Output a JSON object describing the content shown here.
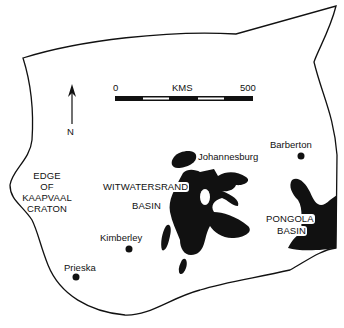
{
  "map": {
    "colors": {
      "ink": "#111111",
      "background": "#ffffff"
    },
    "scale_bar": {
      "start_label": "0",
      "unit_label": "KMS",
      "end_label": "500"
    },
    "north_arrow": {
      "label": "N"
    },
    "labels": {
      "edge": [
        "EDGE",
        "OF",
        "KAAPVAAL",
        "CRATON"
      ],
      "witwatersrand": "WITWATERSRAND",
      "witwatersrand_basin": "BASIN",
      "pongola": "PONGOLA",
      "pongola_basin": "BASIN"
    },
    "towns": [
      {
        "name": "Johannesburg"
      },
      {
        "name": "Barberton"
      },
      {
        "name": "Kimberley"
      },
      {
        "name": "Prieska"
      }
    ]
  }
}
